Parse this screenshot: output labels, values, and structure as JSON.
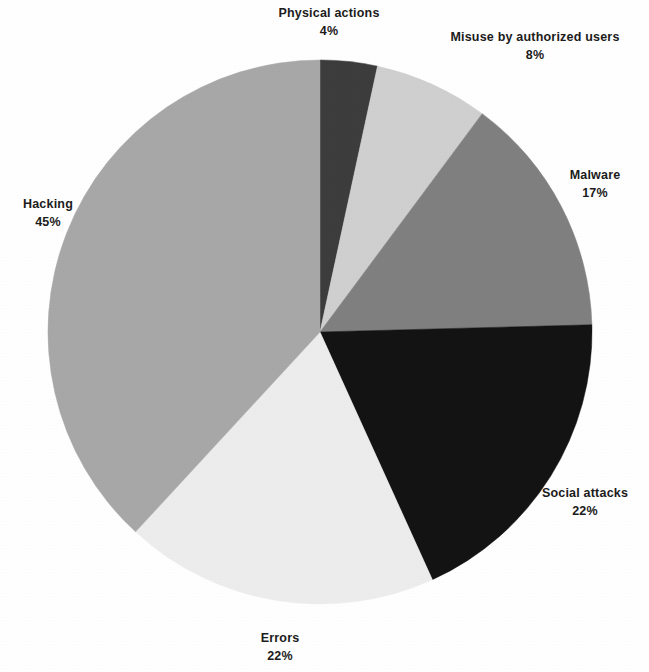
{
  "chart_data": {
    "type": "pie",
    "title": "",
    "subtitle": "",
    "xlabel": "",
    "ylabel": "",
    "legend_position": "none",
    "grid": false,
    "labels_show_percent": true,
    "total_percent": 118,
    "categories": [
      "Physical actions",
      "Misuse by authorized users",
      "Malware",
      "Social attacks",
      "Errors",
      "Hacking"
    ],
    "values": [
      4,
      8,
      17,
      22,
      22,
      45
    ],
    "value_labels": [
      "4%",
      "8%",
      "17%",
      "22%",
      "22%",
      "45%"
    ],
    "colors": [
      "#3d3d3d",
      "#d0d0d0",
      "#808080",
      "#131313",
      "#ededed",
      "#a8a8a8"
    ],
    "slices": [
      {
        "name": "Physical actions",
        "value": 4,
        "value_label": "4%",
        "color": "#3d3d3d"
      },
      {
        "name": "Misuse by authorized users",
        "value": 8,
        "value_label": "8%",
        "color": "#d0d0d0"
      },
      {
        "name": "Malware",
        "value": 17,
        "value_label": "17%",
        "color": "#808080"
      },
      {
        "name": "Social attacks",
        "value": 22,
        "value_label": "22%",
        "color": "#131313"
      },
      {
        "name": "Errors",
        "value": 22,
        "value_label": "22%",
        "color": "#ededed"
      },
      {
        "name": "Hacking",
        "value": 45,
        "value_label": "45%",
        "color": "#a8a8a8"
      }
    ],
    "geometry": {
      "center_x": 320,
      "center_y": 332,
      "radius": 272,
      "start_angle_deg": -90,
      "direction": "clockwise"
    }
  },
  "labels": {
    "physical_actions": {
      "name": "Physical actions",
      "value": "4%"
    },
    "misuse": {
      "name": "Misuse by authorized users",
      "value": "8%"
    },
    "malware": {
      "name": "Malware",
      "value": "17%"
    },
    "social_attacks": {
      "name": "Social attacks",
      "value": "22%"
    },
    "errors": {
      "name": "Errors",
      "value": "22%"
    },
    "hacking": {
      "name": "Hacking",
      "value": "45%"
    }
  },
  "page": {
    "background_color": "#ffffff",
    "text_color": "#1c1c1c"
  }
}
